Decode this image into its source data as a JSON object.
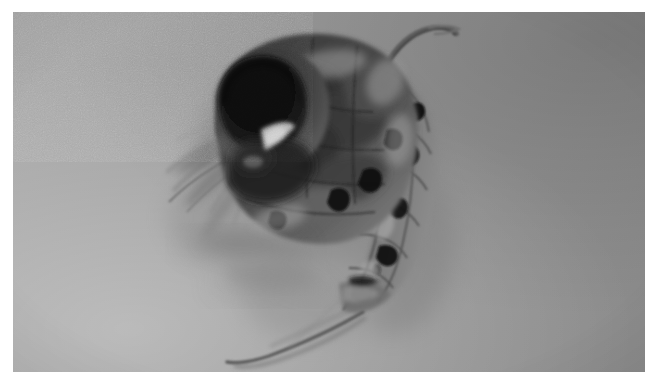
{
  "image": {
    "kind": "photomicrograph",
    "subject_label": "copepod-zooplankton-specimen",
    "caption": "",
    "mode": "grayscale",
    "orientation": "landscape",
    "border": {
      "present": true,
      "color": "#ffffff",
      "left_px": 13,
      "top_px": 12,
      "right_px": 6,
      "bottom_px": 15
    },
    "canvas": {
      "width_px": 651,
      "height_px": 387
    },
    "frame": {
      "x_px": 13,
      "y_px": 12,
      "width_px": 632,
      "height_px": 360
    }
  },
  "background": {
    "name": "gray-slide-background",
    "base_color": "#9a9a9a",
    "light_corner": "#a8a8a8",
    "dark_corner": "#8a8a8a",
    "gradient_direction": "bottom-left-light to top-right-dark",
    "grain": "fine film grain",
    "grain_opacity": 0.3
  },
  "subject": {
    "name": "copepod",
    "common_name": "zooplankton specimen",
    "position": "upper-center-right",
    "bounding_box_px": {
      "x": 150,
      "y": 25,
      "width": 290,
      "height": 345
    },
    "darkest_tone": "#0d0d0d",
    "mid_tone": "#4a4a4a",
    "light_tone": "#bdbdbd",
    "parts": [
      {
        "name": "compound-eye",
        "tone": "#101010",
        "note": "large dark round ocular mass, upper left of head"
      },
      {
        "name": "head-cephalosome",
        "tone": "#3a3a3a",
        "note": "rounded anterior capsule"
      },
      {
        "name": "prosome-thorax",
        "tone": "#474747",
        "note": "mottled segmented body with internal structures"
      },
      {
        "name": "rostral-hook-spine",
        "tone": "#5a5a5a",
        "note": "thin curved hook arching up and right at top"
      },
      {
        "name": "urosome-abdomen",
        "tone": "#6e6e6e",
        "note": "segmented tapering abdomen, right side, with dark joint spots"
      },
      {
        "name": "caudal-rami-setae",
        "tone": "#5c5c5c",
        "note": "long tail filaments trailing to lower left"
      },
      {
        "name": "antennules-setae",
        "tone": "#8a8a8a",
        "note": "fine hair-like antennae fanning to the left"
      },
      {
        "name": "swimming-legs",
        "tone": "#7d7d7d",
        "note": "out-of-focus appendage shadows below body"
      },
      {
        "name": "specular-highlight",
        "tone": "#cfcfcf",
        "note": "bright triangular highlight adjacent to the eye"
      }
    ]
  }
}
